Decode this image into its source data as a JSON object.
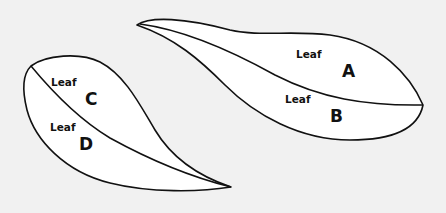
{
  "diagram": {
    "background": "#f1f1f1",
    "leaf_fill": "#ffffff",
    "stroke_color": "#111111",
    "groups": [
      {
        "name": "right-leaf-pair",
        "labels": [
          {
            "word": "Leaf",
            "letter": "A"
          },
          {
            "word": "Leaf",
            "letter": "B"
          }
        ]
      },
      {
        "name": "left-leaf-pair",
        "labels": [
          {
            "word": "Leaf",
            "letter": "C"
          },
          {
            "word": "Leaf",
            "letter": "D"
          }
        ]
      }
    ]
  }
}
